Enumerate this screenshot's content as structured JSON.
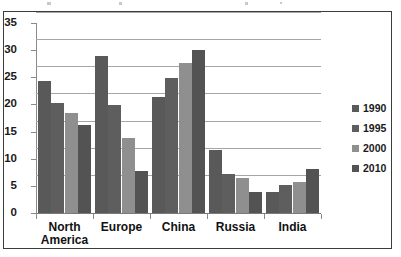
{
  "chart_data": {
    "type": "bar",
    "title": "",
    "xlabel": "",
    "ylabel": "",
    "categories": [
      "North America",
      "Europe",
      "China",
      "Russia",
      "India"
    ],
    "category_lines": [
      [
        "North",
        "America"
      ],
      [
        "Europe"
      ],
      [
        "China"
      ],
      [
        "Russia"
      ],
      [
        "India"
      ]
    ],
    "series": [
      {
        "name": "1990",
        "color": "#595959",
        "values": [
          24.3,
          28.9,
          21.3,
          11.6,
          3.9
        ]
      },
      {
        "name": "1995",
        "color": "#5e5e5e",
        "values": [
          20.3,
          19.9,
          24.8,
          7.1,
          5.1
        ]
      },
      {
        "name": "2000",
        "color": "#8f8f8f",
        "values": [
          18.5,
          13.8,
          27.6,
          6.4,
          5.8
        ]
      },
      {
        "name": "2010",
        "color": "#535353",
        "values": [
          16.3,
          7.8,
          30.0,
          3.9,
          8.1
        ]
      }
    ],
    "ylim": [
      0,
      35
    ],
    "yticks": [
      0,
      5,
      10,
      15,
      20,
      25,
      30,
      35
    ],
    "ytick_labels": [
      "0",
      "5",
      "10",
      "15",
      "20",
      "25",
      "30",
      "35"
    ],
    "grid": true,
    "legend_position": "right"
  }
}
